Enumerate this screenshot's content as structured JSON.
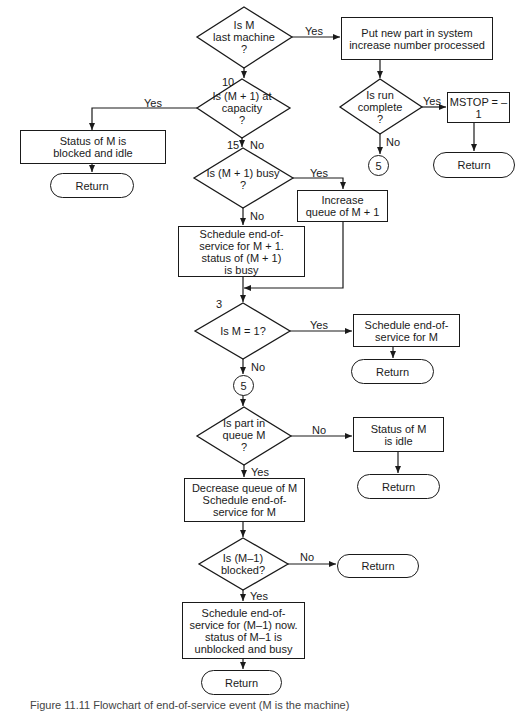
{
  "flowchart": {
    "decisions": {
      "last_machine": "Is M\nlast machine\n?",
      "at_capacity": "Is (M + 1) at\ncapacity\n?",
      "busy": "Is (M + 1) busy\n?",
      "run_complete": "Is run\ncomplete\n?",
      "m_equals_1": "Is M = 1?",
      "part_in_queue": "Is part in\nqueue M\n?",
      "prev_blocked": "Is (M–1)\nblocked?"
    },
    "processes": {
      "put_new_part": "Put new part in system\nincrease number processed",
      "mstop": "MSTOP = –1",
      "blocked_idle": "Status of M is\nblocked and idle",
      "increase_queue": "Increase\nqueue of M + 1",
      "schedule_next": "Schedule end-of-\nservice for M + 1.\nstatus of (M + 1)\nis busy",
      "schedule_m": "Schedule end-of-\nservice for M",
      "status_idle": "Status of M\nis idle",
      "decrease_queue": "Decrease queue of M\nSchedule end-of-\nservice for M",
      "schedule_prev": "Schedule end-of-\nservice for (M–1) now.\nstatus of M–1 is\nunblocked and busy"
    },
    "terminals": {
      "return_label": "Return"
    },
    "connectors": {
      "label": "5"
    },
    "statement_numbers": {
      "n10": "10",
      "n15": "15",
      "n3": "3"
    },
    "edge_labels": {
      "yes": "Yes",
      "no": "No"
    }
  },
  "caption": "Figure 11.11  Flowchart of end-of-service event (M is the machine)"
}
